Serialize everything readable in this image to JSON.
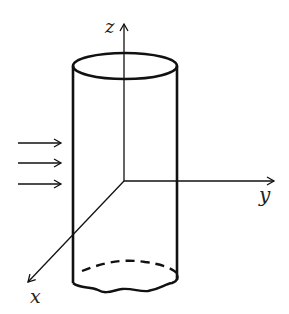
{
  "diagram": {
    "axes": {
      "z": {
        "label": "z"
      },
      "y": {
        "label": "y"
      },
      "x": {
        "label": "x"
      }
    },
    "flow_arrows": {
      "count": 3,
      "direction": "positive y"
    },
    "colors": {
      "stroke": "#111111",
      "background": "#ffffff"
    }
  }
}
